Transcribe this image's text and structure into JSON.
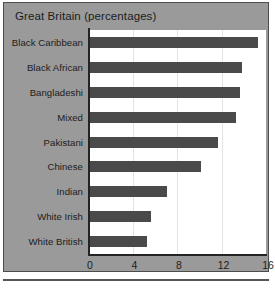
{
  "chart_data": {
    "type": "bar",
    "orientation": "horizontal",
    "title": "Great Britain (percentages)",
    "xlabel": "",
    "ylabel": "",
    "categories": [
      "Black Caribbean",
      "Black African",
      "Bangladeshi",
      "Mixed",
      "Pakistani",
      "Chinese",
      "Indian",
      "White Irish",
      "White British"
    ],
    "values": [
      15.1,
      13.7,
      13.5,
      13.1,
      11.5,
      10.0,
      6.9,
      5.5,
      5.1
    ],
    "xlim": [
      0,
      16
    ],
    "xticks": [
      "0",
      "4",
      "8",
      "12",
      "16"
    ],
    "xtick_values": [
      0,
      4,
      8,
      12,
      16
    ],
    "gridlines": [
      4,
      8,
      12
    ],
    "grid": true,
    "legend": "none",
    "bar_color": "#4a4a4a",
    "panel_color": "#9a9a9a",
    "plot_background": "#ffffff",
    "axis_color": "#242424"
  }
}
